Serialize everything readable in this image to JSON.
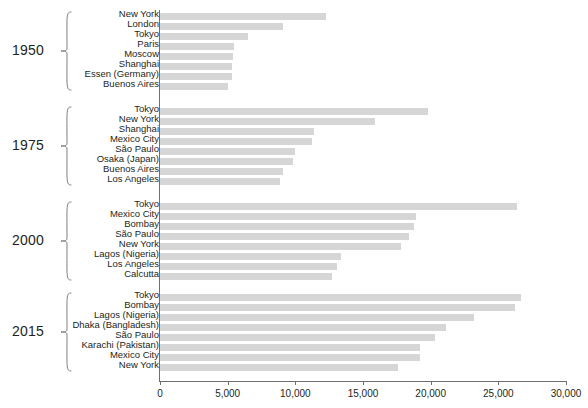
{
  "chart_data": {
    "type": "bar",
    "orientation": "horizontal",
    "title": "",
    "xlabel": "",
    "ylabel": "",
    "xlim": [
      0,
      30000
    ],
    "xticks": [
      0,
      5000,
      10000,
      15000,
      20000,
      25000,
      30000
    ],
    "xtick_labels": [
      "0",
      "5,000",
      "10,000",
      "15,000",
      "20,000",
      "25,000",
      "30,000"
    ],
    "grid": false,
    "legend": null,
    "bar_color": "#d6d6d6",
    "axis_color": "#6f6f6f",
    "text_color": "#231f20",
    "groups": [
      {
        "year": "1950",
        "categories": [
          "New York",
          "London",
          "Tokyo",
          "Paris",
          "Moscow",
          "Shanghai",
          "Essen (Germany)",
          "Buenos Aires"
        ],
        "values": [
          12300,
          9100,
          6500,
          5500,
          5400,
          5300,
          5300,
          5000
        ]
      },
      {
        "year": "1975",
        "categories": [
          "Tokyo",
          "New York",
          "Shanghai",
          "Mexico City",
          "São Paulo",
          "Osaka (Japan)",
          "Buenos Aires",
          "Los Angeles"
        ],
        "values": [
          19800,
          15900,
          11400,
          11200,
          10000,
          9800,
          9100,
          8900
        ]
      },
      {
        "year": "2000",
        "categories": [
          "Tokyo",
          "Mexico City",
          "Bombay",
          "São Paulo",
          "New York",
          "Lagos (Nigeria)",
          "Los Angeles",
          "Calcutta"
        ],
        "values": [
          26400,
          18900,
          18800,
          18400,
          17800,
          13400,
          13100,
          12700
        ]
      },
      {
        "year": "2015",
        "categories": [
          "Tokyo",
          "Bombay",
          "Lagos (Nigeria)",
          "Dhaka (Bangladesh)",
          "São Paulo",
          "Karachi (Pakistan)",
          "Mexico City",
          "New York"
        ],
        "values": [
          26700,
          26200,
          23200,
          21100,
          20300,
          19200,
          19200,
          17600
        ]
      }
    ]
  }
}
